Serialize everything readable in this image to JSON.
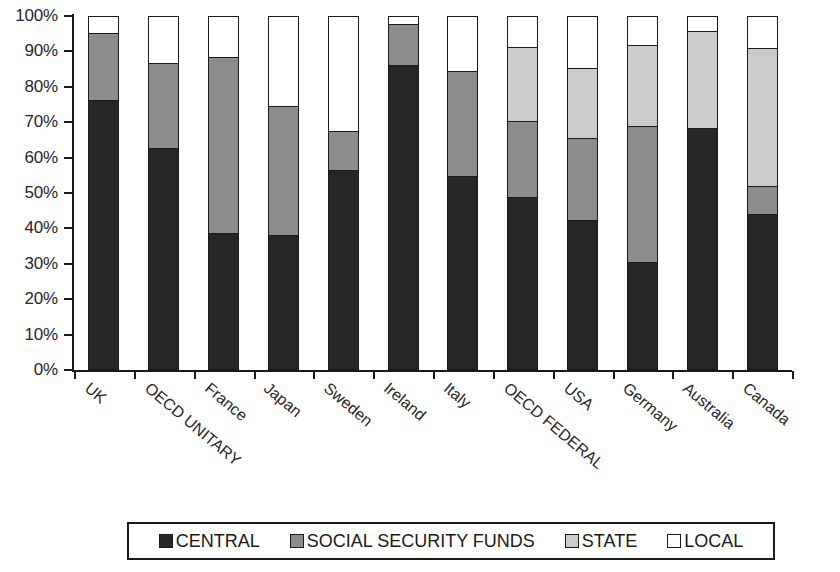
{
  "chart_data": {
    "type": "bar",
    "subtype": "stacked-percent",
    "title": "",
    "xlabel": "",
    "ylabel": "",
    "ylim": [
      0,
      100
    ],
    "grid": false,
    "legend_position": "bottom",
    "y_tick_labels": [
      "0%",
      "10%",
      "20%",
      "30%",
      "40%",
      "50%",
      "60%",
      "70%",
      "80%",
      "90%",
      "100%"
    ],
    "y_ticks": [
      0,
      10,
      20,
      30,
      40,
      50,
      60,
      70,
      80,
      90,
      100
    ],
    "categories": [
      "UK",
      "OECD UNITARY",
      "France",
      "Japan",
      "Sweden",
      "Ireland",
      "Italy",
      "OECD FEDERAL",
      "USA",
      "Germany",
      "Australia",
      "Canada"
    ],
    "series": [
      {
        "name": "CENTRAL",
        "color": "#262626",
        "values": [
          76.5,
          63,
          38.5,
          38,
          56.5,
          86.5,
          55,
          49,
          42.5,
          30.5,
          68.5,
          44
        ]
      },
      {
        "name": "SOCIAL SECURITY FUNDS",
        "color": "#8c8c8c",
        "values": [
          19,
          24,
          50,
          36.5,
          11,
          11.5,
          29.5,
          21.5,
          23,
          38.5,
          0,
          8
        ]
      },
      {
        "name": "STATE",
        "color": "#cbcbcb",
        "values": [
          0,
          0,
          0,
          0,
          0,
          0,
          0,
          21,
          20,
          23,
          27.5,
          39
        ]
      },
      {
        "name": "LOCAL",
        "color": "#ffffff",
        "values": [
          4.5,
          13,
          11.5,
          25.5,
          32.5,
          2,
          15.5,
          8.5,
          14.5,
          8,
          4,
          9
        ]
      }
    ]
  },
  "legend": {
    "entries": [
      {
        "label": "CENTRAL",
        "swatch": "#262626"
      },
      {
        "label": "SOCIAL SECURITY FUNDS",
        "swatch": "#8c8c8c"
      },
      {
        "label": "STATE",
        "swatch": "#cbcbcb"
      },
      {
        "label": "LOCAL",
        "swatch": "#ffffff"
      }
    ]
  }
}
